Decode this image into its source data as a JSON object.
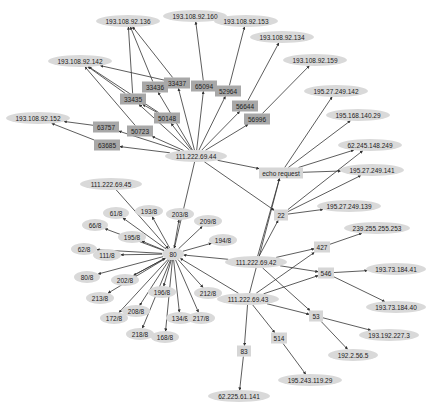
{
  "diagram": {
    "title": "",
    "colors": {
      "edge": "#333333",
      "ellipse_fill": "#d9d9d9",
      "port_box_fill": "#a8a8a8",
      "light_box_fill": "#d6d6d6",
      "background": "#ffffff"
    },
    "nodes": [
      {
        "id": "n0",
        "label": "193.108.92.136",
        "shape": "ellipse",
        "x": 128,
        "y": 21,
        "w": 56
      },
      {
        "id": "n1",
        "label": "193.108.92.160",
        "shape": "ellipse",
        "x": 195,
        "y": 16,
        "w": 56
      },
      {
        "id": "n2",
        "label": "193.108.92.153",
        "shape": "ellipse",
        "x": 246,
        "y": 21,
        "w": 56
      },
      {
        "id": "n3",
        "label": "193.108.92.134",
        "shape": "ellipse",
        "x": 282,
        "y": 37,
        "w": 56
      },
      {
        "id": "n4",
        "label": "193.108.92.142",
        "shape": "ellipse",
        "x": 80,
        "y": 61,
        "w": 56
      },
      {
        "id": "n5",
        "label": "193.108.92.159",
        "shape": "ellipse",
        "x": 315,
        "y": 60,
        "w": 56
      },
      {
        "id": "n6",
        "label": "195.27.249.142",
        "shape": "ellipse",
        "x": 336,
        "y": 91,
        "w": 56
      },
      {
        "id": "n7",
        "label": "195.168.140.29",
        "shape": "ellipse",
        "x": 358,
        "y": 115,
        "w": 56
      },
      {
        "id": "n8",
        "label": "193.108.92.152",
        "shape": "ellipse",
        "x": 38,
        "y": 118,
        "w": 56
      },
      {
        "id": "n9",
        "label": "62.245.148.249",
        "shape": "ellipse",
        "x": 370,
        "y": 145,
        "w": 56
      },
      {
        "id": "n10",
        "label": "195.27.249.141",
        "shape": "ellipse",
        "x": 372,
        "y": 170,
        "w": 56
      },
      {
        "id": "n11",
        "label": "195.27.249.139",
        "shape": "ellipse",
        "x": 349,
        "y": 206,
        "w": 56
      },
      {
        "id": "n12",
        "label": "239.255.255.253",
        "shape": "ellipse",
        "x": 377,
        "y": 228,
        "w": 58
      },
      {
        "id": "n13",
        "label": "193.73.184.41",
        "shape": "ellipse",
        "x": 396,
        "y": 269,
        "w": 52
      },
      {
        "id": "n14",
        "label": "193.73.184.40",
        "shape": "ellipse",
        "x": 396,
        "y": 307,
        "w": 52
      },
      {
        "id": "n15",
        "label": "193.192.227.3",
        "shape": "ellipse",
        "x": 389,
        "y": 335,
        "w": 52
      },
      {
        "id": "n16",
        "label": "192.2.56.5",
        "shape": "ellipse",
        "x": 353,
        "y": 355,
        "w": 42
      },
      {
        "id": "n17",
        "label": "195.243.119.29",
        "shape": "ellipse",
        "x": 310,
        "y": 380,
        "w": 56
      },
      {
        "id": "n18",
        "label": "62.225.61.141",
        "shape": "ellipse",
        "x": 239,
        "y": 396,
        "w": 54
      },
      {
        "id": "p0",
        "label": "33437",
        "shape": "rect-dark",
        "x": 177,
        "y": 83,
        "w": 22
      },
      {
        "id": "p1",
        "label": "33436",
        "shape": "rect-dark",
        "x": 155,
        "y": 87,
        "w": 22
      },
      {
        "id": "p2",
        "label": "65094",
        "shape": "rect-dark",
        "x": 204,
        "y": 86,
        "w": 22
      },
      {
        "id": "p3",
        "label": "52964",
        "shape": "rect-dark",
        "x": 228,
        "y": 91,
        "w": 22
      },
      {
        "id": "p4",
        "label": "33435",
        "shape": "rect-dark",
        "x": 133,
        "y": 99,
        "w": 22
      },
      {
        "id": "p5",
        "label": "56644",
        "shape": "rect-dark",
        "x": 245,
        "y": 106,
        "w": 22
      },
      {
        "id": "p6",
        "label": "50148",
        "shape": "rect-dark",
        "x": 167,
        "y": 118,
        "w": 22
      },
      {
        "id": "p7",
        "label": "56996",
        "shape": "rect-dark",
        "x": 257,
        "y": 119,
        "w": 22
      },
      {
        "id": "p8",
        "label": "63757",
        "shape": "rect-dark",
        "x": 106,
        "y": 127,
        "w": 22
      },
      {
        "id": "p9",
        "label": "50723",
        "shape": "rect-dark",
        "x": 140,
        "y": 131,
        "w": 22
      },
      {
        "id": "p10",
        "label": "63685",
        "shape": "rect-dark",
        "x": 107,
        "y": 145,
        "w": 22
      },
      {
        "id": "h44",
        "label": "111.222.69.44",
        "shape": "ellipse",
        "x": 196,
        "y": 156,
        "w": 54
      },
      {
        "id": "echo",
        "label": "echo request",
        "shape": "rect-light",
        "x": 281,
        "y": 173,
        "w": 40
      },
      {
        "id": "p22",
        "label": "22",
        "shape": "rect-light",
        "x": 281,
        "y": 215,
        "w": 10
      },
      {
        "id": "h45",
        "label": "111.222.69.45",
        "shape": "ellipse",
        "x": 111,
        "y": 184,
        "w": 54
      },
      {
        "id": "p80",
        "label": "80",
        "shape": "ellipse",
        "x": 173,
        "y": 254,
        "w": 14
      },
      {
        "id": "s61",
        "label": "61/8",
        "shape": "ellipse",
        "x": 116,
        "y": 213,
        "w": 18
      },
      {
        "id": "s193",
        "label": "193/8",
        "shape": "ellipse",
        "x": 149,
        "y": 211,
        "w": 20
      },
      {
        "id": "s203",
        "label": "203/8",
        "shape": "ellipse",
        "x": 180,
        "y": 214,
        "w": 20
      },
      {
        "id": "s209",
        "label": "209/8",
        "shape": "ellipse",
        "x": 208,
        "y": 221,
        "w": 20
      },
      {
        "id": "s66",
        "label": "66/8",
        "shape": "ellipse",
        "x": 95,
        "y": 225,
        "w": 18
      },
      {
        "id": "s195",
        "label": "195/8",
        "shape": "ellipse",
        "x": 132,
        "y": 237,
        "w": 20
      },
      {
        "id": "s194",
        "label": "194/8",
        "shape": "ellipse",
        "x": 223,
        "y": 240,
        "w": 20
      },
      {
        "id": "s62",
        "label": "62/8",
        "shape": "ellipse",
        "x": 84,
        "y": 249,
        "w": 18
      },
      {
        "id": "s111",
        "label": "111/8",
        "shape": "ellipse",
        "x": 107,
        "y": 255,
        "w": 20
      },
      {
        "id": "s80",
        "label": "80/8",
        "shape": "ellipse",
        "x": 87,
        "y": 277,
        "w": 18
      },
      {
        "id": "s202",
        "label": "202/8",
        "shape": "ellipse",
        "x": 125,
        "y": 280,
        "w": 20
      },
      {
        "id": "s196",
        "label": "196/8",
        "shape": "ellipse",
        "x": 162,
        "y": 292,
        "w": 20
      },
      {
        "id": "s212",
        "label": "212/8",
        "shape": "ellipse",
        "x": 208,
        "y": 293,
        "w": 20
      },
      {
        "id": "s213",
        "label": "213/8",
        "shape": "ellipse",
        "x": 100,
        "y": 298,
        "w": 20
      },
      {
        "id": "s208",
        "label": "208/8",
        "shape": "ellipse",
        "x": 136,
        "y": 311,
        "w": 20
      },
      {
        "id": "s172",
        "label": "172/8",
        "shape": "ellipse",
        "x": 114,
        "y": 318,
        "w": 20
      },
      {
        "id": "s134",
        "label": "134/8",
        "shape": "ellipse",
        "x": 180,
        "y": 318,
        "w": 20
      },
      {
        "id": "s217",
        "label": "217/8",
        "shape": "ellipse",
        "x": 201,
        "y": 318,
        "w": 20
      },
      {
        "id": "s218",
        "label": "218/8",
        "shape": "ellipse",
        "x": 140,
        "y": 334,
        "w": 20
      },
      {
        "id": "s168",
        "label": "168/8",
        "shape": "ellipse",
        "x": 165,
        "y": 337,
        "w": 20
      },
      {
        "id": "h42",
        "label": "111.222.69.42",
        "shape": "ellipse",
        "x": 256,
        "y": 262,
        "w": 54
      },
      {
        "id": "h43",
        "label": "111.222.69.43",
        "shape": "ellipse",
        "x": 248,
        "y": 299,
        "w": 54
      },
      {
        "id": "p427",
        "label": "427",
        "shape": "rect-light",
        "x": 322,
        "y": 247,
        "w": 12
      },
      {
        "id": "p546",
        "label": "546",
        "shape": "rect-light",
        "x": 326,
        "y": 273,
        "w": 12
      },
      {
        "id": "p53",
        "label": "53",
        "shape": "rect-light",
        "x": 316,
        "y": 316,
        "w": 10
      },
      {
        "id": "p514",
        "label": "514",
        "shape": "rect-light",
        "x": 279,
        "y": 338,
        "w": 12
      },
      {
        "id": "p83",
        "label": "83",
        "shape": "rect-light",
        "x": 244,
        "y": 351,
        "w": 10
      }
    ],
    "edges": [
      [
        "h44",
        "p0"
      ],
      [
        "h44",
        "p1"
      ],
      [
        "h44",
        "p2"
      ],
      [
        "h44",
        "p3"
      ],
      [
        "h44",
        "p4"
      ],
      [
        "h44",
        "p5"
      ],
      [
        "h44",
        "p6"
      ],
      [
        "h44",
        "p7"
      ],
      [
        "h44",
        "p8"
      ],
      [
        "h44",
        "p9"
      ],
      [
        "h44",
        "p10"
      ],
      [
        "p0",
        "n0"
      ],
      [
        "p0",
        "n4"
      ],
      [
        "p1",
        "n0"
      ],
      [
        "p4",
        "n0"
      ],
      [
        "p4",
        "n4"
      ],
      [
        "p6",
        "n4"
      ],
      [
        "p6",
        "p4"
      ],
      [
        "p9",
        "n4"
      ],
      [
        "p2",
        "n1"
      ],
      [
        "p3",
        "n2"
      ],
      [
        "p5",
        "n3"
      ],
      [
        "p7",
        "n5"
      ],
      [
        "p8",
        "n8"
      ],
      [
        "p10",
        "n8"
      ],
      [
        "h44",
        "echo"
      ],
      [
        "h44",
        "p22"
      ],
      [
        "h44",
        "p80"
      ],
      [
        "echo",
        "n6"
      ],
      [
        "echo",
        "n7"
      ],
      [
        "echo",
        "n9"
      ],
      [
        "echo",
        "n10"
      ],
      [
        "p22",
        "n9"
      ],
      [
        "p22",
        "n10"
      ],
      [
        "p22",
        "n11"
      ],
      [
        "h45",
        "p80"
      ],
      [
        "p80",
        "s61"
      ],
      [
        "p80",
        "s193"
      ],
      [
        "p80",
        "s203"
      ],
      [
        "p80",
        "s209"
      ],
      [
        "p80",
        "s66"
      ],
      [
        "p80",
        "s195"
      ],
      [
        "p80",
        "s194"
      ],
      [
        "p80",
        "s62"
      ],
      [
        "p80",
        "s111"
      ],
      [
        "p80",
        "s80"
      ],
      [
        "p80",
        "s202"
      ],
      [
        "p80",
        "s196"
      ],
      [
        "p80",
        "s212"
      ],
      [
        "p80",
        "s213"
      ],
      [
        "p80",
        "s208"
      ],
      [
        "p80",
        "s172"
      ],
      [
        "p80",
        "s134"
      ],
      [
        "p80",
        "s217"
      ],
      [
        "p80",
        "s218"
      ],
      [
        "p80",
        "s168"
      ],
      [
        "h42",
        "p80"
      ],
      [
        "h43",
        "p80"
      ],
      [
        "s202",
        "p80"
      ],
      [
        "h42",
        "echo"
      ],
      [
        "h42",
        "p22"
      ],
      [
        "h42",
        "p427"
      ],
      [
        "h42",
        "p546"
      ],
      [
        "h42",
        "p53"
      ],
      [
        "h43",
        "echo"
      ],
      [
        "h43",
        "p427"
      ],
      [
        "h43",
        "p546"
      ],
      [
        "h43",
        "p53"
      ],
      [
        "h43",
        "p514"
      ],
      [
        "h43",
        "p83"
      ],
      [
        "p427",
        "n12"
      ],
      [
        "p546",
        "n13"
      ],
      [
        "p546",
        "n14"
      ],
      [
        "p53",
        "n15"
      ],
      [
        "p53",
        "n16"
      ],
      [
        "p514",
        "n17"
      ],
      [
        "p83",
        "n18"
      ]
    ]
  }
}
